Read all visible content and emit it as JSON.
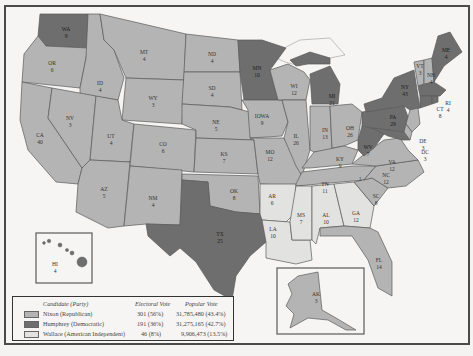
{
  "map": {
    "title": "1968 Presidential Election",
    "colors": {
      "nixon": "#b4b4b4",
      "humphrey": "#6e6e6e",
      "wallace": "#e2e2e0",
      "background": "#f6f5f3",
      "border": "#4a4a4a"
    },
    "states": [
      {
        "abbr": "WA",
        "ev": "9",
        "winner": "humphrey"
      },
      {
        "abbr": "OR",
        "ev": "6",
        "winner": "nixon"
      },
      {
        "abbr": "CA",
        "ev": "40",
        "winner": "nixon"
      },
      {
        "abbr": "ID",
        "ev": "4",
        "winner": "nixon"
      },
      {
        "abbr": "NV",
        "ev": "3",
        "winner": "nixon"
      },
      {
        "abbr": "MT",
        "ev": "4",
        "winner": "nixon"
      },
      {
        "abbr": "WY",
        "ev": "3",
        "winner": "nixon"
      },
      {
        "abbr": "UT",
        "ev": "4",
        "winner": "nixon"
      },
      {
        "abbr": "AZ",
        "ev": "5",
        "winner": "nixon"
      },
      {
        "abbr": "CO",
        "ev": "6",
        "winner": "nixon"
      },
      {
        "abbr": "NM",
        "ev": "4",
        "winner": "nixon"
      },
      {
        "abbr": "ND",
        "ev": "4",
        "winner": "nixon"
      },
      {
        "abbr": "SD",
        "ev": "4",
        "winner": "nixon"
      },
      {
        "abbr": "NE",
        "ev": "5",
        "winner": "nixon"
      },
      {
        "abbr": "KS",
        "ev": "7",
        "winner": "nixon"
      },
      {
        "abbr": "OK",
        "ev": "8",
        "winner": "nixon"
      },
      {
        "abbr": "TX",
        "ev": "25",
        "winner": "humphrey"
      },
      {
        "abbr": "MN",
        "ev": "10",
        "winner": "humphrey"
      },
      {
        "abbr": "IOWA",
        "ev": "9",
        "winner": "nixon"
      },
      {
        "abbr": "MO",
        "ev": "12",
        "winner": "nixon"
      },
      {
        "abbr": "AR",
        "ev": "6",
        "winner": "wallace"
      },
      {
        "abbr": "LA",
        "ev": "10",
        "winner": "wallace"
      },
      {
        "abbr": "WI",
        "ev": "12",
        "winner": "nixon"
      },
      {
        "abbr": "IL",
        "ev": "26",
        "winner": "nixon"
      },
      {
        "abbr": "MI",
        "ev": "21",
        "winner": "humphrey"
      },
      {
        "abbr": "IN",
        "ev": "13",
        "winner": "nixon"
      },
      {
        "abbr": "OH",
        "ev": "26",
        "winner": "nixon"
      },
      {
        "abbr": "KY",
        "ev": "9",
        "winner": "nixon"
      },
      {
        "abbr": "TN",
        "ev": "11",
        "winner": "nixon"
      },
      {
        "abbr": "MS",
        "ev": "7",
        "winner": "wallace"
      },
      {
        "abbr": "AL",
        "ev": "10",
        "winner": "wallace"
      },
      {
        "abbr": "GA",
        "ev": "12",
        "winner": "wallace"
      },
      {
        "abbr": "FL",
        "ev": "14",
        "winner": "nixon"
      },
      {
        "abbr": "SC",
        "ev": "8",
        "winner": "nixon"
      },
      {
        "abbr": "NC",
        "ev": "12",
        "winner": "nixon"
      },
      {
        "abbr": "VA",
        "ev": "12",
        "winner": "nixon"
      },
      {
        "abbr": "WV",
        "ev": "7",
        "winner": "humphrey"
      },
      {
        "abbr": "PA",
        "ev": "29",
        "winner": "humphrey"
      },
      {
        "abbr": "NY",
        "ev": "43",
        "winner": "humphrey"
      },
      {
        "abbr": "VT",
        "ev": "3",
        "winner": "nixon"
      },
      {
        "abbr": "NH",
        "ev": "4",
        "winner": "nixon"
      },
      {
        "abbr": "ME",
        "ev": "4",
        "winner": "humphrey"
      },
      {
        "abbr": "MA",
        "ev": "14",
        "winner": "humphrey"
      },
      {
        "abbr": "RI",
        "ev": "4",
        "winner": "humphrey"
      },
      {
        "abbr": "CT",
        "ev": "8",
        "winner": "humphrey"
      },
      {
        "abbr": "NJ",
        "ev": "17",
        "winner": "nixon"
      },
      {
        "abbr": "DE",
        "ev": "3",
        "winner": "nixon"
      },
      {
        "abbr": "MD",
        "ev": "10",
        "winner": "humphrey"
      },
      {
        "abbr": "DC",
        "ev": "3",
        "winner": "humphrey"
      },
      {
        "abbr": "HI",
        "ev": "4",
        "winner": "humphrey"
      },
      {
        "abbr": "AK",
        "ev": "3",
        "winner": "nixon"
      }
    ],
    "split_vote_note": "1"
  },
  "legend": {
    "headers": {
      "candidate": "Candidate (Party)",
      "electoral": "Electoral Vote",
      "popular": "Popular Vote"
    },
    "rows": [
      {
        "name": "Nixon (Republican)",
        "electoral": "301 (56%)",
        "popular": "31,785,480 (43.4%)",
        "swatch": "#b4b4b4"
      },
      {
        "name": "Humphrey (Democratic)",
        "electoral": "191 (36%)",
        "popular": "31,275,165 (42.7%)",
        "swatch": "#6e6e6e"
      },
      {
        "name": "Wallace (American Independent)",
        "electoral": "46 (8%)",
        "popular": "9,906,473 (13.5%)",
        "swatch": "#e2e2e0"
      }
    ]
  }
}
